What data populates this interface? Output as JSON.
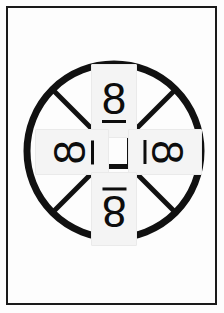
{
  "page": {
    "width": 224,
    "height": 313,
    "background_color": "#fdfdfd",
    "frame_color": "#1a1a1a"
  },
  "diagram": {
    "name": "rotation-wheel",
    "wheel": {
      "center_x": 114,
      "center_y": 151,
      "radius": 90,
      "ring_color": "#111111",
      "ring_thickness": 7,
      "spoke_color": "#111111",
      "spoke_thickness": 5,
      "spoke_count": 4,
      "hub": {
        "shape": "square",
        "size": 36,
        "stroke_color": "#111111",
        "stroke_thickness": 5,
        "fill_color": "#fdfdfd"
      }
    },
    "placeholder_box": {
      "fill_color": "#f4f4f4",
      "border_color": "#eaeaea"
    },
    "glyph_color": "#0d0d0d",
    "positions": [
      {
        "id": "top",
        "label": "top",
        "character": "8",
        "underline": true,
        "rotation_degrees": 0,
        "orientation": "upright"
      },
      {
        "id": "right",
        "label": "right",
        "character": "8",
        "underline": true,
        "rotation_degrees": 90,
        "orientation": "rotated-clockwise"
      },
      {
        "id": "bottom",
        "label": "bottom",
        "character": "8",
        "underline": true,
        "rotation_degrees": 180,
        "orientation": "upside-down"
      },
      {
        "id": "left",
        "label": "left",
        "character": "8",
        "underline": true,
        "rotation_degrees": 270,
        "orientation": "rotated-counter-clockwise"
      }
    ]
  }
}
